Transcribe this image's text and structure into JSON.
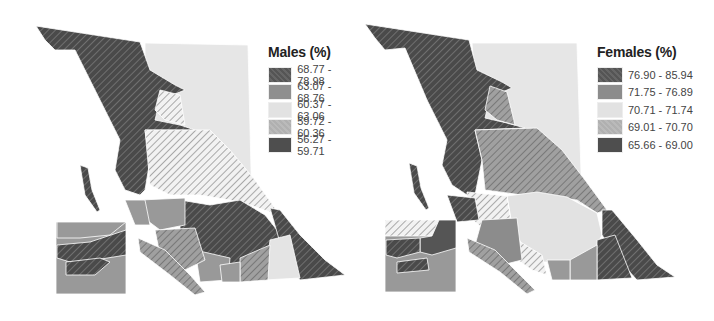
{
  "maps": [
    {
      "id": "males",
      "legend": {
        "title": "Males (%)",
        "items": [
          {
            "label": "68.77 - 78.98",
            "color": "#5a5a5a",
            "hatch": true
          },
          {
            "label": "63.07 - 68.76",
            "color": "#8f8f8f",
            "hatch": false
          },
          {
            "label": "60.37 - 63.06",
            "color": "#e2e2e2",
            "hatch": false
          },
          {
            "label": "59.72 - 60.36",
            "color": "#b4b4b4",
            "hatch": true
          },
          {
            "label": "56.27 - 59.71",
            "color": "#4e4e4e",
            "hatch": false
          }
        ]
      }
    },
    {
      "id": "females",
      "legend": {
        "title": "Females (%)",
        "items": [
          {
            "label": "76.90 - 85.94",
            "color": "#555555",
            "hatch": true
          },
          {
            "label": "71.75 - 76.89",
            "color": "#8c8c8c",
            "hatch": false
          },
          {
            "label": "70.71 - 71.74",
            "color": "#e2e2e2",
            "hatch": false
          },
          {
            "label": "69.01 - 70.70",
            "color": "#b4b4b4",
            "hatch": true
          },
          {
            "label": "65.66 - 69.00",
            "color": "#4e4e4e",
            "hatch": false
          }
        ]
      }
    }
  ]
}
